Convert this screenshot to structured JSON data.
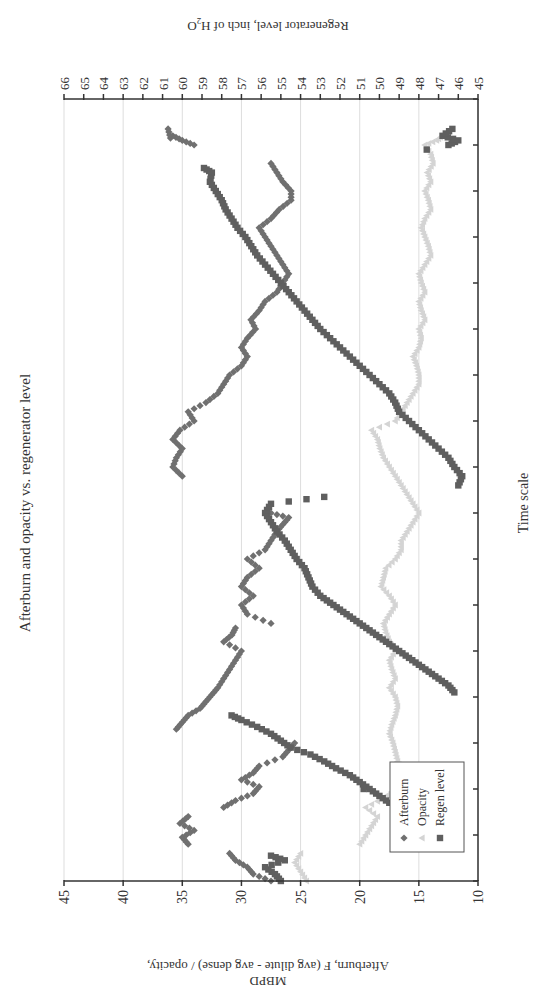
{
  "figure": {
    "orientation": "rotated 90deg counterclockwise on page",
    "title": "Afterburn and opacity vs. regenerator level",
    "xlabel": "Time scale",
    "ylabel_left_line1": "Afterburn, F (avg dilute - avg dense) / opacity,",
    "ylabel_left_line2": "MBPD",
    "ylabel_right": "Regenerator level, inch of H",
    "ylabel_right_sub": "2",
    "ylabel_right_tail": "O",
    "legend": [
      {
        "label": "Afterburn",
        "marker": "diamond",
        "color": "#707070"
      },
      {
        "label": "Opacity",
        "marker": "triangle",
        "color": "#d4d4d4"
      },
      {
        "label": "Regen level",
        "marker": "square",
        "color": "#5f5f5f"
      }
    ]
  },
  "chart_data": {
    "type": "scatter",
    "title": "Afterburn and opacity vs. regenerator level",
    "xlabel": "Time scale",
    "ylabel": "Afterburn, F (avg dilute - avg dense) / opacity, MBPD",
    "ylabel_right": "Regenerator level, inch of H2O",
    "xlim": [
      0,
      17
    ],
    "x_ticks": [
      0,
      1,
      2,
      3,
      4,
      5,
      6,
      7,
      8,
      9,
      10,
      11,
      12,
      13,
      14,
      15,
      16,
      17
    ],
    "x_tick_labels_visible": false,
    "ylim": [
      10,
      45
    ],
    "y_ticks": [
      10,
      15,
      20,
      25,
      30,
      35,
      40,
      45
    ],
    "ylim_right": [
      45,
      66
    ],
    "y_ticks_right": [
      45,
      46,
      47,
      48,
      49,
      50,
      51,
      52,
      53,
      54,
      55,
      56,
      57,
      58,
      59,
      60,
      61,
      62,
      63,
      64,
      65,
      66
    ],
    "grid": "horizontal major lines at left-axis ticks",
    "legend_position": "upper left inside plot",
    "series": [
      {
        "name": "Afterburn",
        "axis": "left",
        "marker": "diamond",
        "color": "#707070",
        "points": [
          [
            0.0,
            27.5
          ],
          [
            0.15,
            29.0
          ],
          [
            0.3,
            29.5
          ],
          [
            0.45,
            30.5
          ],
          [
            0.6,
            31.0
          ],
          [
            0.8,
            34.5
          ],
          [
            0.95,
            35.0
          ],
          [
            1.1,
            34.0
          ],
          [
            1.25,
            35.2
          ],
          [
            1.4,
            34.5
          ],
          [
            1.6,
            31.5
          ],
          [
            1.75,
            30.5
          ],
          [
            1.9,
            29.0
          ],
          [
            2.05,
            28.5
          ],
          [
            2.2,
            30.0
          ],
          [
            2.35,
            29.0
          ],
          [
            2.5,
            28.5
          ],
          [
            2.7,
            26.5
          ],
          [
            2.85,
            26.0
          ],
          [
            3.0,
            25.5
          ],
          [
            3.3,
            35.5
          ],
          [
            3.45,
            35.0
          ],
          [
            3.6,
            34.5
          ],
          [
            3.75,
            33.5
          ],
          [
            3.9,
            33.0
          ],
          [
            4.05,
            32.5
          ],
          [
            4.2,
            32.0
          ],
          [
            4.4,
            31.5
          ],
          [
            4.6,
            31.0
          ],
          [
            4.8,
            30.5
          ],
          [
            5.0,
            30.0
          ],
          [
            5.2,
            31.5
          ],
          [
            5.35,
            30.8
          ],
          [
            5.5,
            30.5
          ],
          [
            5.6,
            27.5
          ],
          [
            5.8,
            29.5
          ],
          [
            6.0,
            30.0
          ],
          [
            6.2,
            29.0
          ],
          [
            6.4,
            30.0
          ],
          [
            6.6,
            29.5
          ],
          [
            6.8,
            28.5
          ],
          [
            7.0,
            29.5
          ],
          [
            7.2,
            28.0
          ],
          [
            7.4,
            27.5
          ],
          [
            7.6,
            27.0
          ],
          [
            7.75,
            26.5
          ],
          [
            7.9,
            26.0
          ],
          [
            8.0,
            27.5
          ],
          [
            8.8,
            35.0
          ],
          [
            9.0,
            35.8
          ],
          [
            9.2,
            35.5
          ],
          [
            9.4,
            35.0
          ],
          [
            9.6,
            35.8
          ],
          [
            9.8,
            35.2
          ],
          [
            10.0,
            34.0
          ],
          [
            10.2,
            34.5
          ],
          [
            10.4,
            33.0
          ],
          [
            10.6,
            32.0
          ],
          [
            10.8,
            31.5
          ],
          [
            11.0,
            31.0
          ],
          [
            11.2,
            30.0
          ],
          [
            11.4,
            29.5
          ],
          [
            11.6,
            30.0
          ],
          [
            11.8,
            29.5
          ],
          [
            12.0,
            28.8
          ],
          [
            12.2,
            29.2
          ],
          [
            12.4,
            28.5
          ],
          [
            12.6,
            28.0
          ],
          [
            12.8,
            27.0
          ],
          [
            13.0,
            26.5
          ],
          [
            13.2,
            26.0
          ],
          [
            13.4,
            26.5
          ],
          [
            13.6,
            27.0
          ],
          [
            13.8,
            27.5
          ],
          [
            14.0,
            28.0
          ],
          [
            14.2,
            28.5
          ],
          [
            14.4,
            27.5
          ],
          [
            14.6,
            26.8
          ],
          [
            14.8,
            25.8
          ],
          [
            15.0,
            25.8
          ],
          [
            15.2,
            26.5
          ],
          [
            15.4,
            27.0
          ],
          [
            15.6,
            27.5
          ],
          [
            16.0,
            34.0
          ],
          [
            16.1,
            35.0
          ],
          [
            16.2,
            35.8
          ],
          [
            16.15,
            36.0
          ],
          [
            16.35,
            36.2
          ]
        ]
      },
      {
        "name": "Opacity",
        "axis": "left",
        "marker": "triangle",
        "color": "#d4d4d4",
        "points": [
          [
            0.0,
            24.5
          ],
          [
            0.2,
            25.0
          ],
          [
            0.4,
            25.5
          ],
          [
            0.6,
            25.0
          ],
          [
            0.8,
            20.0
          ],
          [
            1.0,
            19.5
          ],
          [
            1.2,
            19.0
          ],
          [
            1.4,
            18.5
          ],
          [
            1.6,
            19.5
          ],
          [
            1.8,
            18.0
          ],
          [
            2.0,
            17.0
          ],
          [
            2.2,
            16.5
          ],
          [
            2.4,
            16.5
          ],
          [
            2.6,
            16.8
          ],
          [
            2.8,
            17.0
          ],
          [
            3.0,
            17.2
          ],
          [
            3.2,
            17.5
          ],
          [
            3.4,
            17.3
          ],
          [
            3.6,
            17.0
          ],
          [
            3.8,
            16.8
          ],
          [
            4.0,
            17.0
          ],
          [
            4.2,
            17.5
          ],
          [
            4.4,
            17.0
          ],
          [
            4.6,
            17.3
          ],
          [
            4.8,
            17.5
          ],
          [
            5.0,
            17.0
          ],
          [
            5.2,
            17.5
          ],
          [
            5.4,
            17.8
          ],
          [
            5.6,
            18.0
          ],
          [
            5.8,
            17.5
          ],
          [
            6.0,
            17.0
          ],
          [
            6.2,
            17.5
          ],
          [
            6.4,
            18.2
          ],
          [
            6.6,
            18.0
          ],
          [
            6.8,
            17.8
          ],
          [
            7.0,
            17.0
          ],
          [
            7.2,
            16.5
          ],
          [
            7.4,
            16.5
          ],
          [
            7.6,
            16.0
          ],
          [
            7.8,
            15.5
          ],
          [
            8.0,
            15.0
          ],
          [
            8.2,
            15.5
          ],
          [
            8.4,
            16.0
          ],
          [
            8.6,
            16.5
          ],
          [
            8.8,
            17.0
          ],
          [
            9.0,
            17.5
          ],
          [
            9.2,
            18.0
          ],
          [
            9.4,
            18.3
          ],
          [
            9.6,
            18.5
          ],
          [
            9.8,
            19.0
          ],
          [
            10.0,
            17.0
          ],
          [
            10.2,
            16.5
          ],
          [
            10.4,
            16.0
          ],
          [
            10.6,
            15.5
          ],
          [
            10.8,
            15.0
          ],
          [
            11.0,
            15.0
          ],
          [
            11.2,
            15.2
          ],
          [
            11.4,
            15.5
          ],
          [
            11.6,
            15.0
          ],
          [
            11.8,
            14.8
          ],
          [
            12.0,
            15.0
          ],
          [
            12.2,
            14.5
          ],
          [
            12.4,
            14.8
          ],
          [
            12.6,
            15.0
          ],
          [
            12.8,
            14.5
          ],
          [
            13.0,
            14.8
          ],
          [
            13.2,
            15.0
          ],
          [
            13.4,
            14.5
          ],
          [
            13.6,
            14.0
          ],
          [
            13.8,
            14.2
          ],
          [
            14.0,
            14.5
          ],
          [
            14.2,
            14.8
          ],
          [
            14.4,
            14.5
          ],
          [
            14.6,
            14.0
          ],
          [
            14.8,
            14.2
          ],
          [
            15.0,
            14.5
          ],
          [
            15.2,
            14.0
          ],
          [
            15.4,
            14.3
          ],
          [
            15.6,
            13.8
          ],
          [
            15.8,
            14.0
          ],
          [
            16.0,
            14.5
          ],
          [
            16.1,
            13.5
          ],
          [
            16.2,
            13.0
          ],
          [
            16.3,
            12.5
          ]
        ]
      },
      {
        "name": "Regen level",
        "axis": "right",
        "marker": "square",
        "color": "#5f5f5f",
        "points": [
          [
            0.0,
            55.0
          ],
          [
            0.15,
            55.3
          ],
          [
            0.3,
            55.8
          ],
          [
            0.45,
            54.8
          ],
          [
            0.55,
            55.5
          ],
          [
            0.9,
            46.8
          ],
          [
            1.0,
            47.2
          ],
          [
            1.1,
            47.5
          ],
          [
            1.25,
            48.0
          ],
          [
            1.4,
            48.6
          ],
          [
            1.55,
            48.8
          ],
          [
            1.7,
            49.5
          ],
          [
            1.85,
            50.0
          ],
          [
            2.0,
            50.5
          ],
          [
            2.15,
            51.0
          ],
          [
            2.3,
            51.5
          ],
          [
            2.45,
            52.2
          ],
          [
            2.6,
            52.8
          ],
          [
            2.75,
            53.5
          ],
          [
            2.9,
            54.5
          ],
          [
            3.05,
            55.0
          ],
          [
            3.2,
            55.5
          ],
          [
            3.35,
            56.2
          ],
          [
            3.5,
            57.0
          ],
          [
            3.6,
            57.5
          ],
          [
            2.0,
            50.8
          ],
          [
            4.1,
            46.2
          ],
          [
            4.25,
            46.5
          ],
          [
            4.4,
            47.0
          ],
          [
            4.55,
            47.5
          ],
          [
            4.7,
            48.0
          ],
          [
            4.85,
            48.5
          ],
          [
            5.0,
            49.0
          ],
          [
            5.15,
            49.5
          ],
          [
            5.3,
            50.0
          ],
          [
            5.45,
            50.5
          ],
          [
            5.6,
            51.0
          ],
          [
            5.75,
            51.5
          ],
          [
            5.9,
            52.0
          ],
          [
            6.05,
            52.5
          ],
          [
            6.2,
            53.0
          ],
          [
            6.4,
            53.4
          ],
          [
            6.6,
            53.6
          ],
          [
            6.8,
            53.8
          ],
          [
            7.0,
            54.2
          ],
          [
            7.2,
            54.5
          ],
          [
            7.4,
            54.8
          ],
          [
            7.6,
            55.2
          ],
          [
            7.8,
            55.5
          ],
          [
            8.0,
            55.8
          ],
          [
            8.2,
            55.5
          ],
          [
            8.35,
            52.8
          ],
          [
            8.6,
            46.0
          ],
          [
            8.8,
            45.8
          ],
          [
            9.0,
            46.2
          ],
          [
            9.2,
            46.5
          ],
          [
            9.4,
            47.0
          ],
          [
            9.6,
            47.5
          ],
          [
            9.8,
            48.0
          ],
          [
            10.0,
            48.5
          ],
          [
            10.2,
            49.0
          ],
          [
            10.4,
            49.2
          ],
          [
            10.6,
            49.5
          ],
          [
            10.8,
            50.0
          ],
          [
            11.0,
            50.5
          ],
          [
            11.2,
            51.0
          ],
          [
            11.4,
            51.5
          ],
          [
            11.6,
            52.0
          ],
          [
            11.8,
            52.5
          ],
          [
            12.0,
            53.0
          ],
          [
            12.2,
            53.4
          ],
          [
            12.4,
            53.8
          ],
          [
            12.6,
            54.2
          ],
          [
            12.8,
            54.6
          ],
          [
            13.0,
            55.0
          ],
          [
            13.2,
            55.4
          ],
          [
            13.4,
            55.8
          ],
          [
            13.6,
            56.2
          ],
          [
            13.8,
            56.5
          ],
          [
            14.0,
            56.8
          ],
          [
            14.2,
            57.2
          ],
          [
            14.4,
            57.5
          ],
          [
            14.6,
            57.8
          ],
          [
            14.8,
            58.0
          ],
          [
            15.0,
            58.3
          ],
          [
            15.2,
            58.6
          ],
          [
            15.4,
            58.5
          ],
          [
            15.5,
            58.9
          ],
          [
            16.0,
            46.5
          ],
          [
            16.1,
            46.0
          ],
          [
            16.2,
            46.8
          ],
          [
            16.35,
            46.3
          ],
          [
            15.9,
            47.6
          ]
        ]
      }
    ]
  }
}
